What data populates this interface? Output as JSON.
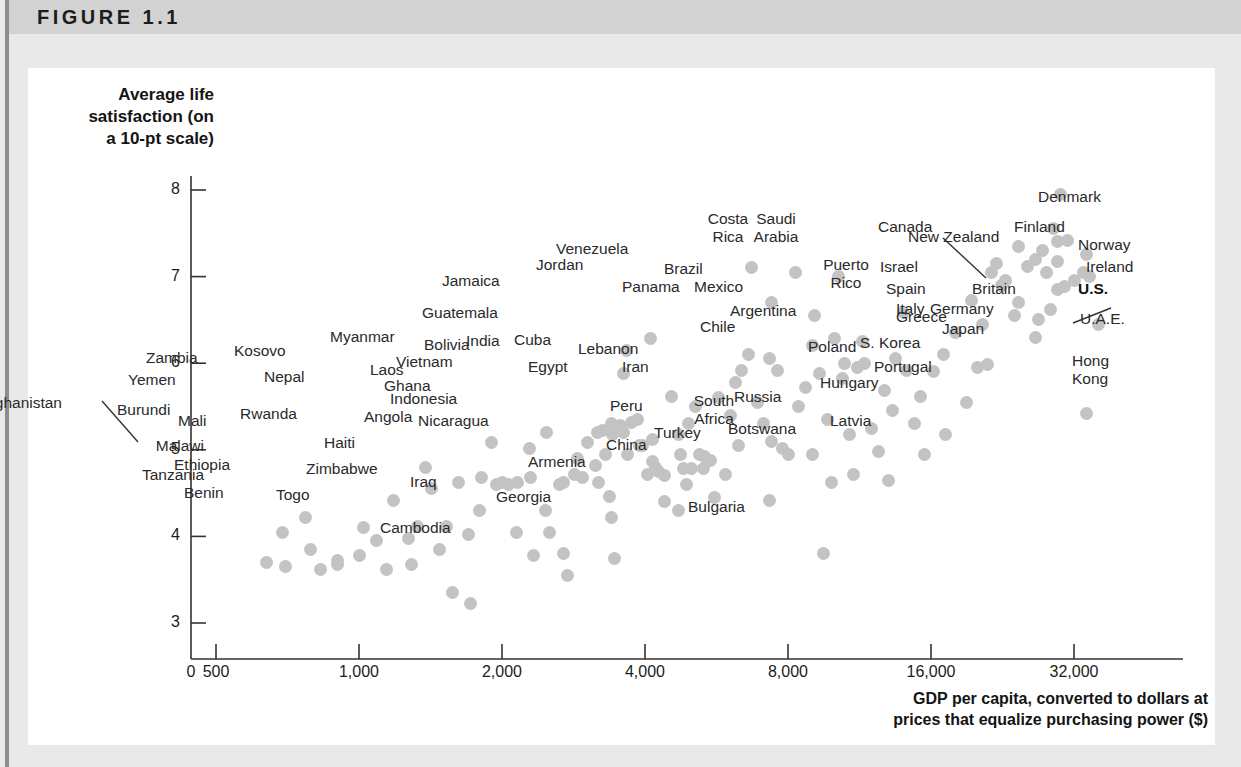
{
  "figure": {
    "label": "FIGURE 1.1"
  },
  "chart_data": {
    "type": "scatter",
    "title": "FIGURE 1.1",
    "xlabel": "GDP per capita, converted to dollars at prices that equalize purchasing power ($)",
    "ylabel": "Average life satisfaction (on a 10-pt scale)",
    "xscale": "log",
    "xtick_labels": [
      "0",
      "500",
      "1,000",
      "2,000",
      "4,000",
      "8,000",
      "16,000",
      "32,000"
    ],
    "xtick_values": [
      0,
      500,
      1000,
      2000,
      4000,
      8000,
      16000,
      32000
    ],
    "ytick_labels": [
      "3",
      "4",
      "5",
      "6",
      "7",
      "8"
    ],
    "ytick_values": [
      3,
      4,
      5,
      6,
      7,
      8
    ],
    "ylim": [
      2.75,
      8.35
    ],
    "grid": false,
    "legend": null,
    "marker_color": "#c3c3c3",
    "points": [
      {
        "name": "Afghanistan",
        "gdp": 690,
        "satisfaction": 4.05,
        "labeled": true
      },
      {
        "name": "Malawi",
        "gdp": 790,
        "satisfaction": 3.85,
        "labeled": true
      },
      {
        "name": "Burundi",
        "gdp": 770,
        "satisfaction": 4.22,
        "labeled": true
      },
      {
        "name": "Tanzania",
        "gdp": 900,
        "satisfaction": 3.72,
        "labeled": true
      },
      {
        "name": "Yemen",
        "gdp": 1180,
        "satisfaction": 4.42,
        "labeled": true
      },
      {
        "name": "Zambia",
        "gdp": 1380,
        "satisfaction": 4.8,
        "labeled": true
      },
      {
        "name": "Mali",
        "gdp": 1270,
        "satisfaction": 3.98,
        "labeled": true
      },
      {
        "name": "Ethiopia",
        "gdp": 1290,
        "satisfaction": 3.67,
        "labeled": true
      },
      {
        "name": "Rwanda",
        "gdp": 1530,
        "satisfaction": 4.12,
        "labeled": true
      },
      {
        "name": "Benin",
        "gdp": 1570,
        "satisfaction": 3.35,
        "labeled": true
      },
      {
        "name": "Togo",
        "gdp": 1720,
        "satisfaction": 3.22,
        "labeled": true
      },
      {
        "name": "Kosovo",
        "gdp": 1900,
        "satisfaction": 5.08,
        "labeled": true
      },
      {
        "name": "Nepal",
        "gdp": 2000,
        "satisfaction": 4.62,
        "labeled": true
      },
      {
        "name": "Haiti",
        "gdp": 2150,
        "satisfaction": 4.05,
        "labeled": true
      },
      {
        "name": "Zimbabwe",
        "gdp": 2330,
        "satisfaction": 3.78,
        "labeled": true
      },
      {
        "name": "Myanmar",
        "gdp": 2480,
        "satisfaction": 5.2,
        "labeled": true
      },
      {
        "name": "Laos",
        "gdp": 3150,
        "satisfaction": 4.82,
        "labeled": true
      },
      {
        "name": "Ghana",
        "gdp": 3200,
        "satisfaction": 4.62,
        "labeled": true
      },
      {
        "name": "Angola",
        "gdp": 3400,
        "satisfaction": 4.22,
        "labeled": true
      },
      {
        "name": "Bolivia",
        "gdp": 3850,
        "satisfaction": 5.35,
        "labeled": true
      },
      {
        "name": "Vietnam",
        "gdp": 3900,
        "satisfaction": 5.05,
        "labeled": true
      },
      {
        "name": "Indonesia",
        "gdp": 4200,
        "satisfaction": 4.8,
        "labeled": true
      },
      {
        "name": "Nicaragua",
        "gdp": 4400,
        "satisfaction": 4.4,
        "labeled": true
      },
      {
        "name": "Cambodia",
        "gdp": 2750,
        "satisfaction": 3.55,
        "labeled": true
      },
      {
        "name": "Iraq",
        "gdp": 2700,
        "satisfaction": 3.8,
        "labeled": true
      },
      {
        "name": "Georgia",
        "gdp": 3450,
        "satisfaction": 3.75,
        "labeled": true
      },
      {
        "name": "India",
        "gdp": 3400,
        "satisfaction": 5.3,
        "labeled": true
      },
      {
        "name": "Cuba",
        "gdp": 3750,
        "satisfaction": 5.32,
        "labeled": true
      },
      {
        "name": "Guatemala",
        "gdp": 3600,
        "satisfaction": 5.88,
        "labeled": true
      },
      {
        "name": "Jamaica",
        "gdp": 3650,
        "satisfaction": 6.15,
        "labeled": true
      },
      {
        "name": "Egypt",
        "gdp": 4150,
        "satisfaction": 5.12,
        "labeled": true
      },
      {
        "name": "Armenia",
        "gdp": 4700,
        "satisfaction": 4.3,
        "labeled": true
      },
      {
        "name": "Jordan",
        "gdp": 4100,
        "satisfaction": 6.28,
        "labeled": true
      },
      {
        "name": "Lebanon",
        "gdp": 4950,
        "satisfaction": 5.3,
        "labeled": true
      },
      {
        "name": "Peru",
        "gdp": 5300,
        "satisfaction": 4.78,
        "labeled": true
      },
      {
        "name": "China",
        "gdp": 5600,
        "satisfaction": 4.45,
        "labeled": true
      },
      {
        "name": "Iran",
        "gdp": 6300,
        "satisfaction": 5.05,
        "labeled": true
      },
      {
        "name": "Venezuela",
        "gdp": 6700,
        "satisfaction": 7.1,
        "labeled": true
      },
      {
        "name": "Brazil",
        "gdp": 7400,
        "satisfaction": 6.7,
        "labeled": true
      },
      {
        "name": "Panama",
        "gdp": 7300,
        "satisfaction": 6.05,
        "labeled": true
      },
      {
        "name": "Turkey",
        "gdp": 7300,
        "satisfaction": 4.42,
        "labeled": true
      },
      {
        "name": "Costa Rica",
        "gdp": 8300,
        "satisfaction": 7.05,
        "labeled": true
      },
      {
        "name": "Mexico",
        "gdp": 9100,
        "satisfaction": 6.55,
        "labeled": true
      },
      {
        "name": "Saudi Arabia",
        "gdp": 10200,
        "satisfaction": 7.0,
        "labeled": true
      },
      {
        "name": "Chile",
        "gdp": 10500,
        "satisfaction": 6.0,
        "labeled": true
      },
      {
        "name": "South Africa",
        "gdp": 9000,
        "satisfaction": 4.95,
        "labeled": true
      },
      {
        "name": "Argentina",
        "gdp": 11500,
        "satisfaction": 6.25,
        "labeled": true
      },
      {
        "name": "Botswana",
        "gdp": 9900,
        "satisfaction": 4.62,
        "labeled": true
      },
      {
        "name": "Russia",
        "gdp": 11000,
        "satisfaction": 4.72,
        "labeled": true
      },
      {
        "name": "Bulgaria",
        "gdp": 9500,
        "satisfaction": 3.8,
        "labeled": true
      },
      {
        "name": "Puerto Rico",
        "gdp": 14000,
        "satisfaction": 6.58,
        "labeled": true
      },
      {
        "name": "Poland",
        "gdp": 13300,
        "satisfaction": 5.45,
        "labeled": true
      },
      {
        "name": "Latvia",
        "gdp": 13000,
        "satisfaction": 4.65,
        "labeled": true
      },
      {
        "name": "Hungary",
        "gdp": 15500,
        "satisfaction": 4.95,
        "labeled": true
      },
      {
        "name": "Portugal",
        "gdp": 17200,
        "satisfaction": 5.18,
        "labeled": true
      },
      {
        "name": "S. Korea",
        "gdp": 19000,
        "satisfaction": 5.55,
        "labeled": true
      },
      {
        "name": "Greece",
        "gdp": 20000,
        "satisfaction": 5.95,
        "labeled": true
      },
      {
        "name": "Israel",
        "gdp": 21500,
        "satisfaction": 7.05,
        "labeled": true
      },
      {
        "name": "Spain",
        "gdp": 22500,
        "satisfaction": 6.9,
        "labeled": true
      },
      {
        "name": "Italy",
        "gdp": 24000,
        "satisfaction": 6.55,
        "labeled": true
      },
      {
        "name": "New Zealand",
        "gdp": 24500,
        "satisfaction": 7.35,
        "labeled": true
      },
      {
        "name": "Japan",
        "gdp": 26500,
        "satisfaction": 6.3,
        "labeled": true
      },
      {
        "name": "Germany",
        "gdp": 27000,
        "satisfaction": 6.5,
        "labeled": true
      },
      {
        "name": "Canada",
        "gdp": 29500,
        "satisfaction": 7.4,
        "labeled": true
      },
      {
        "name": "Finland",
        "gdp": 29000,
        "satisfaction": 7.55,
        "labeled": true
      },
      {
        "name": "Denmark",
        "gdp": 30000,
        "satisfaction": 7.95,
        "labeled": true
      },
      {
        "name": "Britain",
        "gdp": 29500,
        "satisfaction": 6.85,
        "labeled": true
      },
      {
        "name": "Norway",
        "gdp": 34000,
        "satisfaction": 7.25,
        "labeled": true
      },
      {
        "name": "Ireland",
        "gdp": 33500,
        "satisfaction": 7.05,
        "labeled": true
      },
      {
        "name": "U.S.",
        "gdp": 34500,
        "satisfaction": 7.0,
        "labeled": true
      },
      {
        "name": "U.A.E.",
        "gdp": 36000,
        "satisfaction": 6.45,
        "labeled": true
      },
      {
        "name": "Hong Kong",
        "gdp": 34000,
        "satisfaction": 5.42,
        "labeled": true
      }
    ],
    "annotations": [
      {
        "text": "Afghanistan",
        "type": "leader-line"
      },
      {
        "text": "Canada",
        "type": "leader-line"
      },
      {
        "text": "Ireland",
        "type": "leader-line"
      }
    ]
  },
  "axes": {
    "y_title_lines": [
      "Average life",
      "satisfaction (on",
      "a 10-pt scale)"
    ],
    "x_title_lines": [
      "GDP per capita, converted to dollars at",
      "prices that equalize purchasing power ($)"
    ]
  }
}
